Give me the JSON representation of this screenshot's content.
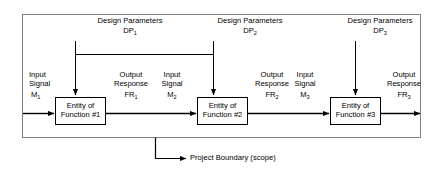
{
  "diagram": {
    "outer_boundary": {
      "label": "Project Boundary (scope)",
      "stroke": "#808080"
    },
    "colors": {
      "line": "#000000",
      "boundary": "#808080",
      "box_fill": "#ffffff",
      "text": "#000000"
    },
    "stages": [
      {
        "design_parameters_label": "Design Parameters",
        "dp_symbol": "DP",
        "dp_index": "1",
        "input_label_line1": "Input",
        "input_label_line2": "Signal",
        "input_symbol": "M",
        "input_index": "1",
        "entity_line1": "Entity of",
        "entity_line2": "Function #1",
        "output_label_line1": "Output",
        "output_label_line2": "Response",
        "output_symbol": "FR",
        "output_index": "1"
      },
      {
        "design_parameters_label": "Design Parameters",
        "dp_symbol": "DP",
        "dp_index": "2",
        "input_label_line1": "Input",
        "input_label_line2": "Signal",
        "input_symbol": "M",
        "input_index": "2",
        "entity_line1": "Entity of",
        "entity_line2": "Function #2",
        "output_label_line1": "Output",
        "output_label_line2": "Response",
        "output_symbol": "FR",
        "output_index": "2"
      },
      {
        "design_parameters_label": "Design Parameters",
        "dp_symbol": "DP",
        "dp_index": "3",
        "input_label_line1": "Input",
        "input_label_line2": "Signal",
        "input_symbol": "M",
        "input_index": "3",
        "entity_line1": "Entity of",
        "entity_line2": "Function #3",
        "output_label_line1": "Output",
        "output_label_line2": "Response",
        "output_symbol": "FR",
        "output_index": "3"
      }
    ]
  }
}
